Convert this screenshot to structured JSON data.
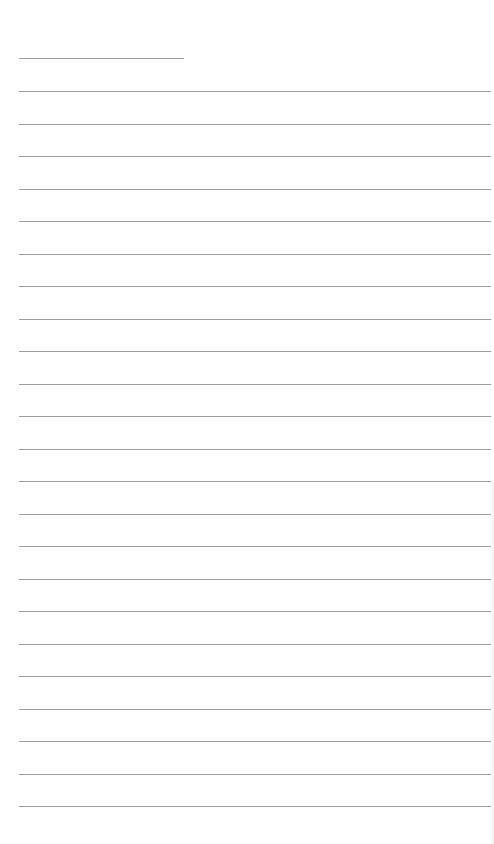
{
  "document": {
    "type": "lined-paper",
    "background_color": "#ffffff",
    "line_color": "#8c8c8c",
    "header_line": {
      "top": 58,
      "left": 19,
      "width": 165
    },
    "ruled_lines": {
      "count": 23,
      "first_top": 91,
      "spacing": 32.5,
      "left": 19,
      "width": 472
    }
  }
}
